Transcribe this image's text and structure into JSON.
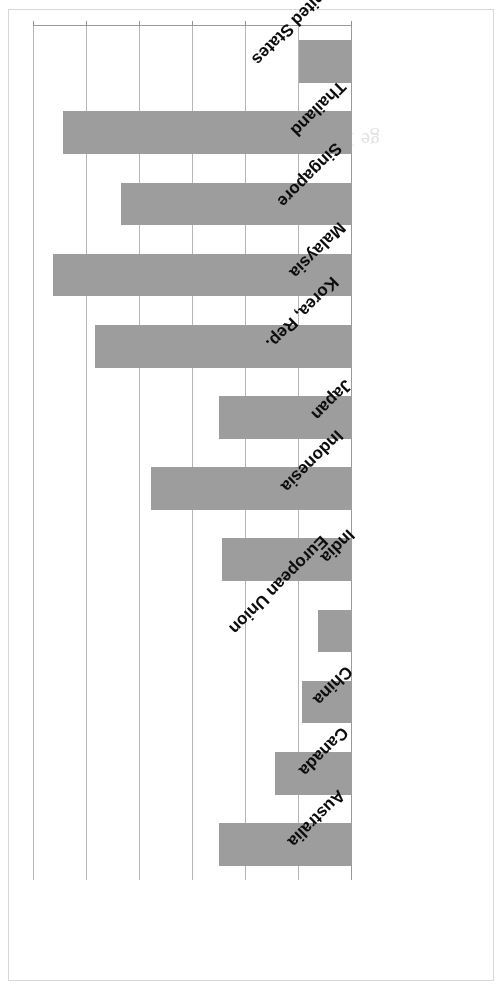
{
  "chart_data": {
    "type": "bar",
    "orientation": "horizontal",
    "title": "",
    "xlabel": "",
    "ylabel": "",
    "categories": [
      "Australia",
      "Canada",
      "China",
      "European Union",
      "India",
      "Indonesia",
      "Japan",
      "Korea, Rep.",
      "Malaysia",
      "Singapore",
      "Thailand",
      "United States"
    ],
    "values": [
      0.5,
      0.29,
      0.19,
      0.13,
      0.49,
      0.76,
      0.5,
      0.97,
      1.13,
      0.87,
      1.09,
      0.2
    ],
    "value_axis_ticks": [
      "0.00",
      "0.20",
      "0.40",
      "0.60",
      "0.80",
      "1.00",
      "1.20"
    ],
    "value_axis_tick_values": [
      0.0,
      0.2,
      0.4,
      0.6,
      0.8,
      1.0,
      1.2
    ],
    "xlim": [
      0,
      1.2
    ],
    "grid": true,
    "legend": "none",
    "bar_color": "#9d9d9d",
    "gridline_color": "#b5b5b5",
    "axis_color": "#9a9a9a",
    "text_color": "#0c0c0c",
    "page_rotation_degrees": 180
  },
  "ghosts": [
    {
      "text": "ge  1 of 1",
      "left": 120,
      "top": 838
    },
    {
      "text": "4 7",
      "left": 300,
      "top": 480
    },
    {
      "text": "2 2",
      "left": 210,
      "top": 560
    }
  ]
}
